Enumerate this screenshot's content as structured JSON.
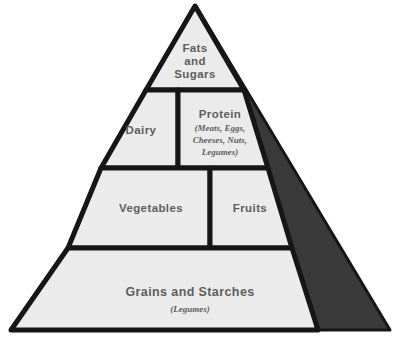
{
  "diagram": {
    "type": "food-pyramid",
    "background_color": "#ffffff",
    "panel_fill_color": "#ebebeb",
    "outline_color": "#161616",
    "shadow_color": "#3a3a3a",
    "text_color": "#5d5d5d"
  },
  "tiers": [
    {
      "id": "tier-1",
      "level": 1,
      "position": "apex",
      "sections": [
        {
          "id": "fats-and-sugars",
          "label_line1": "Fats",
          "label_line2": "and",
          "label_line3": "Sugars",
          "label": "Fats and Sugars",
          "subtext": ""
        }
      ]
    },
    {
      "id": "tier-2",
      "level": 2,
      "position": "upper-middle",
      "sections": [
        {
          "id": "dairy",
          "label": "Dairy",
          "subtext": ""
        },
        {
          "id": "protein",
          "label": "Protein",
          "subtext": "(Meats, Eggs, Cheeses, Nuts, Legumes)",
          "subtext_line1": "(Meats, Eggs,",
          "subtext_line2": "Cheeses, Nuts,",
          "subtext_line3": "Legumes)"
        }
      ]
    },
    {
      "id": "tier-3",
      "level": 3,
      "position": "lower-middle",
      "sections": [
        {
          "id": "vegetables",
          "label": "Vegetables",
          "subtext": ""
        },
        {
          "id": "fruits",
          "label": "Fruits",
          "subtext": ""
        }
      ]
    },
    {
      "id": "tier-4",
      "level": 4,
      "position": "base",
      "sections": [
        {
          "id": "grains-and-starches",
          "label": "Grains and Starches",
          "subtext": "(Legumes)"
        }
      ]
    }
  ]
}
